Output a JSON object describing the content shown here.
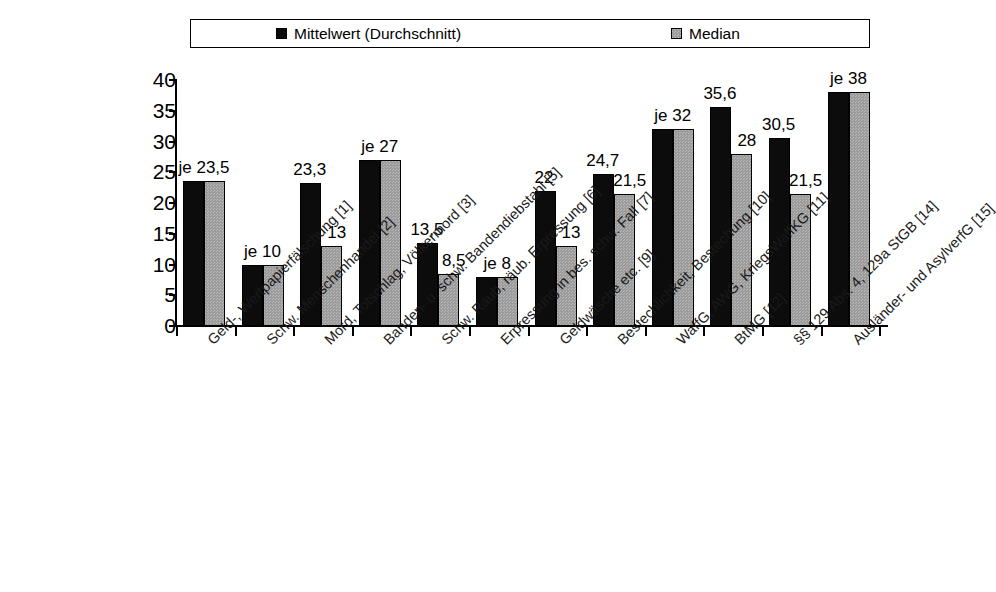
{
  "title_strip": "",
  "legend": {
    "items": [
      {
        "label": "Mittelwert (Durchschnitt)",
        "swatch": "black-square-icon",
        "color": "#0c0c0c"
      },
      {
        "label": "Median",
        "swatch": "gray-square-icon",
        "color": "#9c9c9c"
      }
    ]
  },
  "axis": {
    "y_ticks": [
      "40",
      "35",
      "30",
      "25",
      "20",
      "15",
      "10",
      "5",
      "0"
    ]
  },
  "chart_data": {
    "type": "bar",
    "title": "",
    "xlabel": "",
    "ylabel": "",
    "ylim": [
      0,
      40
    ],
    "ytick_step": 5,
    "grid": false,
    "legend_position": "top",
    "categories": [
      "Geld-, Wertpapierfälschung [1]",
      "Schw. Menschenhandel [2]",
      "Mord, Totschlag, Völkermord [3]",
      "Banden- u. schw. Bandendiebstahl [5]",
      "Schw. Raub, räub. Erpressung [6]",
      "Erpressung in bes. schw. Fall [7]",
      "Geldwäsche etc. [9]",
      "Bestechlichkeit, Bestechung [10]",
      "WaffG, AWG, KriegsWaffKG [11]",
      "BtMG [12]",
      "§§ 129 Abs. 4, 129a StGB [14]",
      "Ausländer- und AsylverfG [15]"
    ],
    "series": [
      {
        "name": "Mittelwert (Durchschnitt)",
        "color": "#0c0c0c",
        "values": [
          23.5,
          10,
          23.3,
          27,
          13.5,
          8,
          22,
          24.7,
          32,
          35.6,
          30.5,
          38
        ]
      },
      {
        "name": "Median",
        "color": "#9c9c9c",
        "values": [
          23.5,
          10,
          13,
          27,
          8.5,
          8,
          13,
          21.5,
          32,
          28,
          21.5,
          38
        ]
      }
    ],
    "point_labels": [
      {
        "text": "je 23,5",
        "kind": "shared"
      },
      {
        "text": "je 10",
        "kind": "shared"
      },
      {
        "text": "23,3",
        "kind": "mean"
      },
      {
        "text": "13",
        "kind": "median"
      },
      {
        "text": "je 27",
        "kind": "shared"
      },
      {
        "text": "13,5",
        "kind": "mean"
      },
      {
        "text": "8,5",
        "kind": "median"
      },
      {
        "text": "je 8",
        "kind": "shared"
      },
      {
        "text": "22",
        "kind": "mean"
      },
      {
        "text": "13",
        "kind": "median"
      },
      {
        "text": "24,7",
        "kind": "mean"
      },
      {
        "text": "21,5",
        "kind": "median"
      },
      {
        "text": "je 32",
        "kind": "shared"
      },
      {
        "text": "35,6",
        "kind": "mean"
      },
      {
        "text": "28",
        "kind": "median"
      },
      {
        "text": "30,5",
        "kind": "mean"
      },
      {
        "text": "21,5",
        "kind": "median"
      },
      {
        "text": "je 38",
        "kind": "shared"
      }
    ]
  }
}
